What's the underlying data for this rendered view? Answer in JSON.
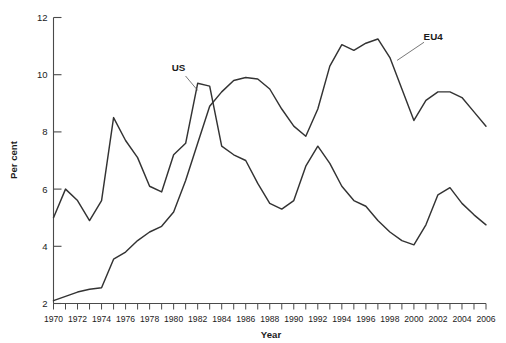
{
  "chart_data": {
    "type": "line",
    "title": "",
    "xlabel": "Year",
    "ylabel": "Per cent",
    "xlim": [
      1970,
      2006
    ],
    "ylim": [
      2,
      12
    ],
    "grid": false,
    "legend_position": "inline-annotation",
    "x": [
      1970,
      1971,
      1972,
      1973,
      1974,
      1975,
      1976,
      1977,
      1978,
      1979,
      1980,
      1981,
      1982,
      1983,
      1984,
      1985,
      1986,
      1987,
      1988,
      1989,
      1990,
      1991,
      1992,
      1993,
      1994,
      1995,
      1996,
      1997,
      1998,
      1999,
      2000,
      2001,
      2002,
      2003,
      2004,
      2005,
      2006
    ],
    "xtick_labels": [
      "1970",
      "1972",
      "1974",
      "1976",
      "1978",
      "1980",
      "1982",
      "1984",
      "1986",
      "1988",
      "1990",
      "1992",
      "1994",
      "1996",
      "1998",
      "2000",
      "2002",
      "2004",
      "2006"
    ],
    "xtick_values": [
      1970,
      1972,
      1974,
      1976,
      1978,
      1980,
      1982,
      1984,
      1986,
      1988,
      1990,
      1992,
      1994,
      1996,
      1998,
      2000,
      2002,
      2004,
      2006
    ],
    "ytick_labels": [
      "2",
      "4",
      "6",
      "8",
      "10",
      "12"
    ],
    "ytick_values": [
      2,
      4,
      6,
      8,
      10,
      12
    ],
    "series": [
      {
        "name": "US",
        "color": "#333333",
        "label_x": 1980.4,
        "label_y": 10.25,
        "leader_to_x": 1982.0,
        "leader_to_y": 9.45,
        "values": [
          5.0,
          6.0,
          5.6,
          4.9,
          5.6,
          8.5,
          7.7,
          7.1,
          6.1,
          5.9,
          7.2,
          7.6,
          9.7,
          9.6,
          7.5,
          7.2,
          7.0,
          6.2,
          5.5,
          5.3,
          5.6,
          6.8,
          7.5,
          6.9,
          6.1,
          5.6,
          5.4,
          4.9,
          4.5,
          4.2,
          4.05,
          4.75,
          5.8,
          6.05,
          5.5,
          5.1,
          4.75
        ]
      },
      {
        "name": "EU4",
        "color": "#333333",
        "label_x": 2001.6,
        "label_y": 11.35,
        "leader_to_x": 1998.6,
        "leader_to_y": 10.5,
        "values": [
          2.1,
          2.25,
          2.4,
          2.5,
          2.55,
          3.55,
          3.8,
          4.2,
          4.5,
          4.7,
          5.2,
          6.3,
          7.6,
          8.9,
          9.4,
          9.8,
          9.9,
          9.85,
          9.5,
          8.8,
          8.2,
          7.85,
          8.8,
          10.3,
          11.05,
          10.85,
          11.1,
          11.25,
          10.6,
          9.5,
          8.4,
          9.1,
          9.4,
          9.4,
          9.2,
          8.7,
          8.2
        ]
      }
    ]
  },
  "axes": {
    "y_title": "Per cent",
    "x_title": "Year"
  }
}
